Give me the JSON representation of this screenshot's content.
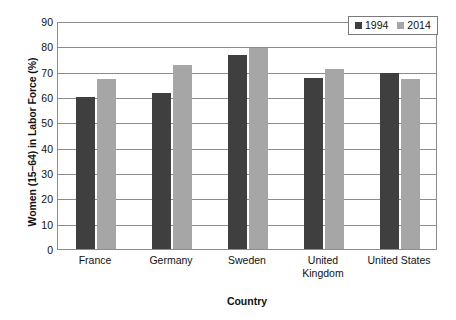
{
  "chart_data": {
    "type": "bar",
    "title": "",
    "xlabel": "Country",
    "ylabel": "Women (15–64) in Labor Force (%)",
    "categories": [
      "France",
      "Germany",
      "Sweden",
      "United Kingdom",
      "United States"
    ],
    "category_lines": [
      [
        "France"
      ],
      [
        "Germany"
      ],
      [
        "Sweden"
      ],
      [
        "United",
        "Kingdom"
      ],
      [
        "United States"
      ]
    ],
    "series": [
      {
        "name": "1994",
        "color": "#3f3f3f",
        "values": [
          60,
          61.5,
          76.5,
          67.5,
          69.5
        ]
      },
      {
        "name": "2014",
        "color": "#a6a6a6",
        "values": [
          67,
          72.5,
          79.5,
          71,
          67
        ]
      }
    ],
    "ylim": [
      0,
      90
    ],
    "ytick_step": 10,
    "yticks": [
      "0",
      "10",
      "20",
      "30",
      "40",
      "50",
      "60",
      "70",
      "80",
      "90"
    ],
    "grid": true,
    "legend_position": "top-right",
    "axis_color": "#8c8c8c"
  },
  "legend": {
    "entries": [
      {
        "label": "1994"
      },
      {
        "label": "2014"
      }
    ]
  }
}
